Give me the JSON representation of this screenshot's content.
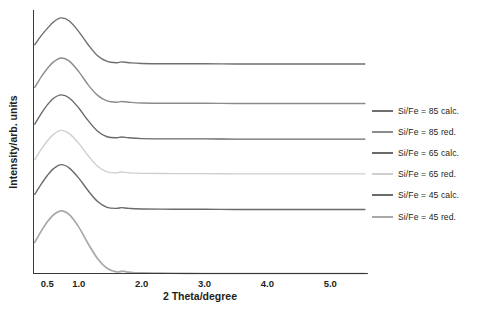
{
  "chart_data": {
    "type": "line",
    "title": "",
    "xlabel": "2 Theta/degree",
    "ylabel": "Intensity/arb. units",
    "xlim": [
      0.28,
      5.6
    ],
    "ylim": [
      0,
      1
    ],
    "xticks": [
      "0.5",
      "1.0",
      "2.0",
      "3.0",
      "4.0",
      "5.0"
    ],
    "xtick_values": [
      0.5,
      1.0,
      2.0,
      3.0,
      4.0,
      5.0
    ],
    "yticks": [],
    "grid": false,
    "legend_position": "right",
    "note": "Stacked small-angle XRD patterns, each curve vertically offset; y axis is arbitrary units with no tick labels.",
    "series": [
      {
        "name": "Si/Fe = 85 calc.",
        "color": "#6f6f6f",
        "offset": 0.795,
        "peak_x": 0.72,
        "peak_height": 0.175,
        "peak_width": 0.3,
        "shoulder_x": 1.68,
        "shoulder_height": 0.012,
        "x": [
          0.3,
          0.4,
          0.5,
          0.6,
          0.72,
          0.85,
          1.0,
          1.15,
          1.3,
          1.45,
          1.6,
          1.68,
          1.8,
          2.0,
          2.5,
          3.0,
          3.5,
          4.0,
          4.5,
          5.0,
          5.55
        ],
        "y": [
          0.868,
          0.902,
          0.93,
          0.955,
          0.97,
          0.958,
          0.918,
          0.868,
          0.826,
          0.805,
          0.8,
          0.803,
          0.8,
          0.797,
          0.796,
          0.796,
          0.795,
          0.795,
          0.795,
          0.795,
          0.795
        ]
      },
      {
        "name": "Si/Fe = 85 red.",
        "color": "#8c8c8c",
        "offset": 0.645,
        "peak_x": 0.74,
        "peak_height": 0.175,
        "peak_width": 0.3,
        "shoulder_x": 1.68,
        "shoulder_height": 0.01,
        "x": [
          0.3,
          0.4,
          0.5,
          0.6,
          0.72,
          0.85,
          1.0,
          1.15,
          1.3,
          1.45,
          1.6,
          1.68,
          1.8,
          2.0,
          2.5,
          3.0,
          3.5,
          4.0,
          4.5,
          5.0,
          5.55
        ],
        "y": [
          0.706,
          0.745,
          0.778,
          0.803,
          0.818,
          0.806,
          0.766,
          0.716,
          0.676,
          0.655,
          0.65,
          0.653,
          0.65,
          0.647,
          0.646,
          0.646,
          0.645,
          0.645,
          0.645,
          0.645,
          0.645
        ]
      },
      {
        "name": "Si/Fe = 65 calc.",
        "color": "#6a6a6a",
        "offset": 0.51,
        "peak_x": 0.74,
        "peak_height": 0.168,
        "peak_width": 0.3,
        "shoulder_x": 1.68,
        "shoulder_height": 0.01,
        "x": [
          0.3,
          0.4,
          0.5,
          0.6,
          0.72,
          0.85,
          1.0,
          1.15,
          1.3,
          1.45,
          1.6,
          1.68,
          1.8,
          2.0,
          2.5,
          3.0,
          3.5,
          4.0,
          4.5,
          5.0,
          5.55
        ],
        "y": [
          0.567,
          0.606,
          0.64,
          0.665,
          0.678,
          0.666,
          0.628,
          0.58,
          0.54,
          0.519,
          0.515,
          0.518,
          0.515,
          0.512,
          0.511,
          0.511,
          0.51,
          0.51,
          0.51,
          0.51,
          0.51
        ]
      },
      {
        "name": "Si/Fe = 65 red.",
        "color": "#cfcfcf",
        "offset": 0.378,
        "peak_x": 0.74,
        "peak_height": 0.165,
        "peak_width": 0.3,
        "shoulder_x": 1.68,
        "shoulder_height": 0.008,
        "x": [
          0.3,
          0.4,
          0.5,
          0.6,
          0.72,
          0.85,
          1.0,
          1.15,
          1.3,
          1.45,
          1.6,
          1.68,
          1.8,
          2.0,
          2.5,
          3.0,
          3.5,
          4.0,
          4.5,
          5.0,
          5.55
        ],
        "y": [
          0.432,
          0.47,
          0.503,
          0.528,
          0.543,
          0.531,
          0.494,
          0.447,
          0.407,
          0.386,
          0.382,
          0.385,
          0.382,
          0.38,
          0.379,
          0.379,
          0.378,
          0.378,
          0.378,
          0.378,
          0.378
        ]
      },
      {
        "name": "Si/Fe = 45 calc.",
        "color": "#6a6a6a",
        "offset": 0.243,
        "peak_x": 0.74,
        "peak_height": 0.17,
        "peak_width": 0.3,
        "shoulder_x": 1.68,
        "shoulder_height": 0.01,
        "x": [
          0.3,
          0.4,
          0.5,
          0.6,
          0.72,
          0.85,
          1.0,
          1.15,
          1.3,
          1.45,
          1.6,
          1.68,
          1.8,
          2.0,
          2.5,
          3.0,
          3.5,
          4.0,
          4.5,
          5.0,
          5.55
        ],
        "y": [
          0.3,
          0.338,
          0.372,
          0.398,
          0.413,
          0.4,
          0.362,
          0.314,
          0.273,
          0.251,
          0.247,
          0.25,
          0.247,
          0.245,
          0.244,
          0.244,
          0.243,
          0.243,
          0.243,
          0.243,
          0.243
        ]
      },
      {
        "name": "Si/Fe = 45 red.",
        "color": "#a8a8a8",
        "offset": 0.0,
        "peak_x": 0.74,
        "peak_height": 0.225,
        "peak_width": 0.3,
        "shoulder_x": 1.7,
        "shoulder_height": 0.01,
        "x": [
          0.3,
          0.4,
          0.5,
          0.6,
          0.72,
          0.85,
          1.0,
          1.15,
          1.3,
          1.45,
          1.6,
          1.7,
          1.8,
          2.0,
          2.5,
          3.0,
          3.5,
          4.0,
          4.5,
          5.0,
          5.55
        ],
        "y": [
          0.118,
          0.16,
          0.196,
          0.223,
          0.238,
          0.223,
          0.176,
          0.113,
          0.056,
          0.02,
          0.006,
          0.009,
          0.005,
          0.002,
          0.001,
          0.0,
          0.0,
          0.0,
          0.0,
          0.0,
          0.0
        ]
      }
    ]
  },
  "legend": {
    "items": [
      {
        "label": "Si/Fe = 85 calc.",
        "color": "#6f6f6f"
      },
      {
        "label": "Si/Fe = 85 red.",
        "color": "#8c8c8c"
      },
      {
        "label": "Si/Fe = 65 calc.",
        "color": "#6a6a6a"
      },
      {
        "label": "Si/Fe = 65 red.",
        "color": "#cfcfcf"
      },
      {
        "label": "Si/Fe = 45 calc.",
        "color": "#6a6a6a"
      },
      {
        "label": "Si/Fe = 45 red.",
        "color": "#a8a8a8"
      }
    ]
  },
  "axes": {
    "x_title": "2 Theta/degree",
    "y_title": "Intensity/arb. units",
    "axis_color": "#3a3a3a"
  }
}
